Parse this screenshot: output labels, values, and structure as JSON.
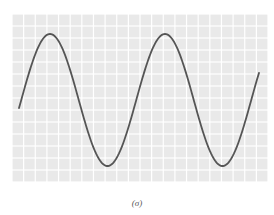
{
  "chart_data": {
    "type": "line",
    "title": "",
    "xlabel": "",
    "ylabel": "",
    "caption": "(σ)",
    "grid": true,
    "legend": [],
    "series": [
      {
        "name": "sine wave",
        "description": "Sinusoid with ~2.1 cycles across the plot; starts near midline rising, peaks, troughs, peaks, troughs, ends rising",
        "amplitude_px": 66,
        "period_px": 115,
        "midline_y_px": 100,
        "points_px": [
          [
            19,
            97
          ],
          [
            50,
            34
          ],
          [
            107,
            166
          ],
          [
            165,
            35
          ],
          [
            226,
            164
          ],
          [
            259,
            82
          ]
        ],
        "color": "#555555"
      }
    ],
    "plot_area": {
      "x": 12,
      "y": 14,
      "width": 256,
      "height": 168
    },
    "grid_style": {
      "cell_color": "#e9e9e9",
      "gap_color": "#ffffff",
      "columns": 22,
      "rows": 14
    }
  }
}
